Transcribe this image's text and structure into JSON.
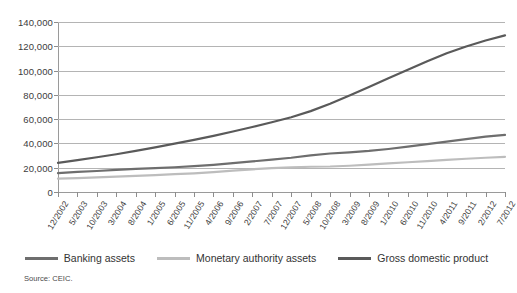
{
  "chart_data": {
    "type": "line",
    "title": "",
    "subtitle": "",
    "xlabel": "",
    "ylabel": "",
    "ylim": [
      0,
      140000
    ],
    "ytick_values": [
      0,
      20000,
      40000,
      60000,
      80000,
      100000,
      120000,
      140000
    ],
    "ytick_labels": [
      "0",
      "20,000",
      "40,000",
      "60,000",
      "80,000",
      "100,000",
      "120,000",
      "140,000"
    ],
    "grid": true,
    "legend_position": "bottom",
    "categories": [
      "12/2002",
      "5/2003",
      "10/2003",
      "3/2004",
      "8/2004",
      "1/2005",
      "6/2005",
      "11/2005",
      "4/2006",
      "9/2006",
      "2/2007",
      "7/2007",
      "12/2007",
      "5/2008",
      "10/2008",
      "3/2009",
      "8/2009",
      "1/2010",
      "6/2010",
      "11/2010",
      "4/2011",
      "9/2011",
      "2/2012",
      "7/2012"
    ],
    "series": [
      {
        "name": "Banking assets",
        "color": "#6e6e6e",
        "values": [
          15500,
          16500,
          17300,
          18200,
          19000,
          19700,
          20400,
          21300,
          22400,
          23800,
          25200,
          26600,
          28200,
          30200,
          31700,
          32600,
          33800,
          35400,
          37300,
          39400,
          41500,
          43600,
          45600,
          47000
        ]
      },
      {
        "name": "Monetary authority assets",
        "color": "#bdbdbd",
        "values": [
          11000,
          11500,
          12000,
          12600,
          13200,
          13900,
          14700,
          15400,
          16400,
          17600,
          18700,
          19600,
          20300,
          20800,
          21000,
          21600,
          22500,
          23500,
          24500,
          25500,
          26500,
          27400,
          28200,
          29000
        ]
      },
      {
        "name": "Gross domestic product",
        "color": "#5a5a5a",
        "values": [
          24000,
          26200,
          28600,
          31100,
          33900,
          36800,
          39800,
          42900,
          46200,
          49800,
          53500,
          57400,
          61600,
          66600,
          72700,
          79500,
          86500,
          93600,
          100700,
          107700,
          114200,
          119800,
          124800,
          129000
        ]
      }
    ]
  },
  "legend": {
    "items": [
      {
        "label": "Banking assets",
        "color": "#6e6e6e"
      },
      {
        "label": "Monetary authority assets",
        "color": "#bdbdbd"
      },
      {
        "label": "Gross domestic product",
        "color": "#5a5a5a"
      }
    ]
  },
  "source": {
    "text": "Source: CEIC."
  }
}
